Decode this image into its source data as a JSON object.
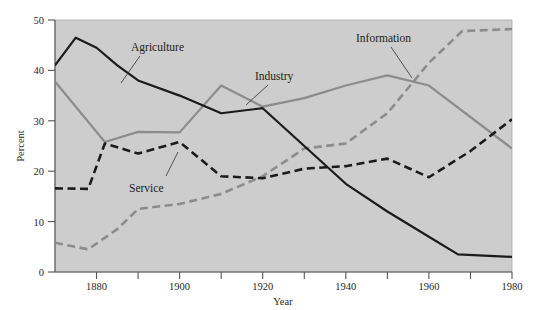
{
  "figure": {
    "background_color": "#ffffff",
    "plot_background_color": "#cdcdcd"
  },
  "axes": {
    "x_title": "Year",
    "y_title": "Percent",
    "x_tick_labels": [
      "1880",
      "1900",
      "1920",
      "1940",
      "1960",
      "1980"
    ],
    "y_tick_labels": [
      "0",
      "10",
      "20",
      "30",
      "40",
      "50"
    ]
  },
  "series_labels": {
    "agriculture": "Agriculture",
    "industry": "Industry",
    "service": "Service",
    "information": "Information"
  },
  "chart_data": {
    "type": "line",
    "title": "",
    "xlabel": "Year",
    "ylabel": "Percent",
    "xlim": [
      1870,
      1980
    ],
    "ylim": [
      0,
      50
    ],
    "grid": false,
    "legend": "inline-annotations",
    "x": [
      1870,
      1880,
      1890,
      1900,
      1910,
      1920,
      1930,
      1940,
      1950,
      1960,
      1970,
      1980
    ],
    "x_ticks": [
      1880,
      1890,
      1900,
      1910,
      1920,
      1930,
      1940,
      1950,
      1960,
      1970,
      1980
    ],
    "x_tick_labels_shown": [
      1880,
      1900,
      1920,
      1940,
      1960,
      1980
    ],
    "y_ticks": [
      0,
      10,
      20,
      30,
      40,
      50
    ],
    "series": [
      {
        "name": "Agriculture",
        "color": "#1b1b1b",
        "style": "solid",
        "x": [
          1870,
          1875,
          1880,
          1885,
          1890,
          1900,
          1910,
          1920,
          1930,
          1940,
          1950,
          1960,
          1967,
          1980
        ],
        "values": [
          41.0,
          46.5,
          44.5,
          41.0,
          38.0,
          35.0,
          31.5,
          32.5,
          25.0,
          17.5,
          12.0,
          7.0,
          3.5,
          3.0
        ]
      },
      {
        "name": "Industry",
        "color": "#8c8c8c",
        "style": "solid",
        "x": [
          1870,
          1882,
          1890,
          1900,
          1910,
          1920,
          1930,
          1940,
          1950,
          1960,
          1980
        ],
        "values": [
          37.8,
          25.8,
          27.8,
          27.7,
          37.0,
          32.8,
          34.5,
          37.0,
          39.0,
          37.0,
          24.5
        ]
      },
      {
        "name": "Service",
        "color": "#1b1b1b",
        "style": "dashed",
        "x": [
          1870,
          1878,
          1882,
          1890,
          1900,
          1910,
          1920,
          1930,
          1940,
          1950,
          1960,
          1970,
          1980
        ],
        "values": [
          16.6,
          16.5,
          25.5,
          23.5,
          25.8,
          19.0,
          18.6,
          20.5,
          21.0,
          22.5,
          18.8,
          24.0,
          30.3
        ]
      },
      {
        "name": "Information",
        "color": "#8c8c8c",
        "style": "dashed",
        "x": [
          1870,
          1878,
          1885,
          1890,
          1900,
          1910,
          1920,
          1930,
          1940,
          1950,
          1960,
          1968,
          1980
        ],
        "values": [
          5.8,
          4.5,
          8.5,
          12.5,
          13.5,
          15.5,
          19.0,
          24.5,
          25.5,
          31.5,
          41.5,
          47.8,
          48.2
        ]
      }
    ]
  }
}
